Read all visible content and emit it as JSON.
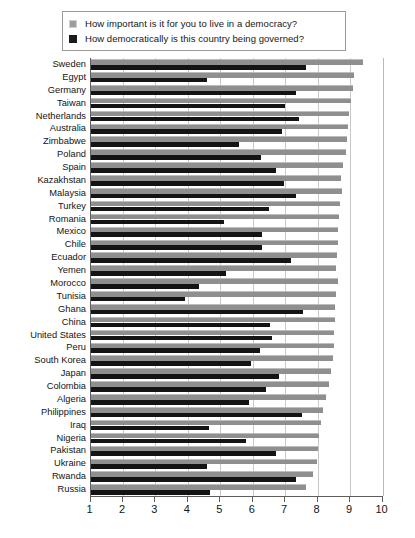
{
  "legend": {
    "items": [
      {
        "swatch": "light-gray-square",
        "label": "How important is it for you to live in a democracy?"
      },
      {
        "swatch": "black-square",
        "label": "How democratically is this country being governed?"
      }
    ]
  },
  "colors": {
    "series_importance": "#8f8f8f",
    "series_governance": "#141414",
    "gridline": "#c8c8c8",
    "axis": "#5d5d5d",
    "background": "#ffffff"
  },
  "chart_data": {
    "type": "bar",
    "orientation": "horizontal",
    "title": "",
    "xlabel": "",
    "ylabel": "",
    "xlim": [
      1,
      10
    ],
    "xticks": [
      1,
      2,
      3,
      4,
      5,
      6,
      7,
      8,
      9,
      10
    ],
    "grid": true,
    "legend_position": "top",
    "categories": [
      "Sweden",
      "Egypt",
      "Germany",
      "Taiwan",
      "Netherlands",
      "Australia",
      "Zimbabwe",
      "Poland",
      "Spain",
      "Kazakhstan",
      "Malaysia",
      "Turkey",
      "Romania",
      "Mexico",
      "Chile",
      "Ecuador",
      "Yemen",
      "Morocco",
      "Tunisia",
      "Ghana",
      "China",
      "United States",
      "Peru",
      "South Korea",
      "Japan",
      "Colombia",
      "Algeria",
      "Philippines",
      "Iraq",
      "Nigeria",
      "Pakistan",
      "Ukraine",
      "Rwanda",
      "Russia"
    ],
    "series": [
      {
        "name": "How important is it for you to live in a democracy?",
        "color": "#8f8f8f",
        "values": [
          9.4,
          9.13,
          9.08,
          9.03,
          8.98,
          8.93,
          8.9,
          8.87,
          8.77,
          8.72,
          8.76,
          8.69,
          8.65,
          8.62,
          8.62,
          8.6,
          8.57,
          8.62,
          8.57,
          8.55,
          8.55,
          8.52,
          8.52,
          8.47,
          8.42,
          8.35,
          8.25,
          8.18,
          8.11,
          8.04,
          8.0,
          7.99,
          7.87,
          7.65
        ]
      },
      {
        "name": "How democratically is this country being governed?",
        "color": "#141414",
        "values": [
          7.65,
          4.6,
          7.34,
          7.0,
          7.44,
          6.9,
          5.57,
          6.24,
          6.71,
          6.97,
          7.32,
          6.5,
          5.1,
          6.3,
          6.3,
          7.18,
          5.18,
          4.35,
          3.92,
          7.56,
          6.53,
          6.6,
          6.23,
          5.95,
          6.8,
          6.4,
          5.88,
          7.52,
          4.64,
          5.78,
          6.71,
          4.6,
          7.32,
          4.68
        ]
      }
    ]
  }
}
